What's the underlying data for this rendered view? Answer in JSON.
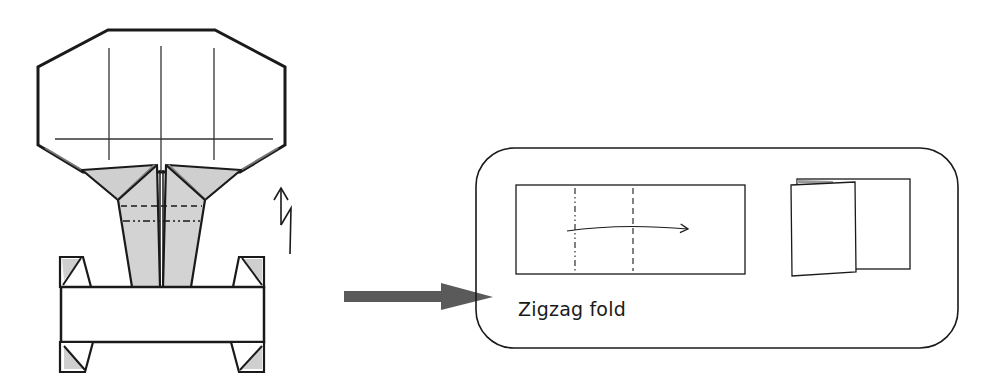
{
  "diagram": {
    "type": "origami-instruction",
    "main_model": {
      "description": "Folded figure with octagonal top, grey shaded collar, tapered stem and horizontal base with corner tabs",
      "fill_color": "#ffffff",
      "shade_color": "#cccccc",
      "line_color": "#1a1a1a"
    },
    "zigzag_symbol": {
      "description": "Up arrow with zigzag indicating a pleat fold"
    },
    "pointer_arrow": {
      "color": "#555555",
      "direction": "right"
    },
    "inset": {
      "caption": "Zigzag fold",
      "border_color": "#1a1a1a"
    }
  }
}
